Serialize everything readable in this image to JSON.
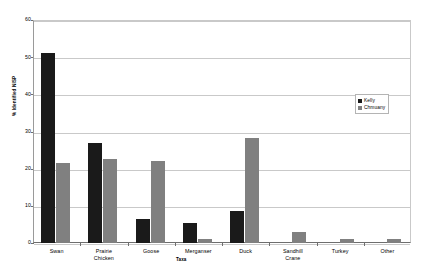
{
  "chart_data": {
    "type": "bar",
    "title": "",
    "xlabel": "Taxa",
    "ylabel": "% Identified NISP",
    "ylim": [
      0,
      60
    ],
    "ytick_step": 10,
    "ytick_labels": [
      "60",
      "50",
      "40",
      "30",
      "20",
      "10",
      "0"
    ],
    "grid": true,
    "legend_position": "right-middle",
    "categories": [
      "Swan",
      "Prairie Chicken",
      "Goose",
      "Merganser",
      "Duck",
      "Sandhill Crane",
      "Turkey",
      "Other"
    ],
    "category_lines": [
      [
        "Swan"
      ],
      [
        "Prairie",
        "Chicken"
      ],
      [
        "Goose"
      ],
      [
        "Merganser"
      ],
      [
        "Duck"
      ],
      [
        "Sandhill",
        "Crane"
      ],
      [
        "Turkey"
      ],
      [
        "Other"
      ]
    ],
    "series": [
      {
        "name": "Kelly",
        "color": "#1a1a1a",
        "values": [
          51.2,
          27.0,
          6.5,
          5.5,
          8.7,
          0,
          0,
          0
        ]
      },
      {
        "name": "Chmuany",
        "color": "#808080",
        "values": [
          21.5,
          22.6,
          22.1,
          1.0,
          28.2,
          3.0,
          1.2,
          1.2
        ]
      }
    ]
  },
  "legend": {
    "entries": [
      {
        "label": "Kelly",
        "color": "#1a1a1a"
      },
      {
        "label": "Chmuany",
        "color": "#808080"
      }
    ]
  },
  "axes": {
    "y_title": "% Identified NISP",
    "x_title": "Taxa"
  },
  "caption": {
    "text": ""
  }
}
